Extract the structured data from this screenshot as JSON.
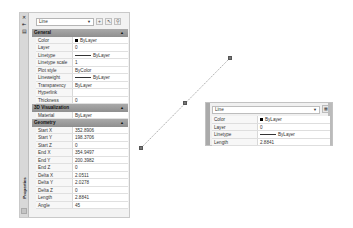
{
  "properties_palette": {
    "title": "Properties",
    "object_type": "Line",
    "toolbar": {
      "toggle_pickadd": "toggle-pickadd-icon",
      "select_objects": "select-objects-icon",
      "quick_select": "quick-select-icon"
    },
    "side_icons": [
      "close-icon",
      "auto-hide-icon",
      "properties-menu-icon"
    ],
    "sections": [
      {
        "name": "General",
        "rows": [
          {
            "key": "Color",
            "value": "ByLayer",
            "swatch": "#000000"
          },
          {
            "key": "Layer",
            "value": "0"
          },
          {
            "key": "Linetype",
            "value": "ByLayer",
            "line": true
          },
          {
            "key": "Linetype scale",
            "value": "1"
          },
          {
            "key": "Plot style",
            "value": "ByColor"
          },
          {
            "key": "Lineweight",
            "value": "ByLayer",
            "line": true
          },
          {
            "key": "Transparency",
            "value": "ByLayer"
          },
          {
            "key": "Hyperlink",
            "value": ""
          },
          {
            "key": "Thickness",
            "value": "0"
          }
        ]
      },
      {
        "name": "3D Visualization",
        "rows": [
          {
            "key": "Material",
            "value": "ByLayer"
          }
        ]
      },
      {
        "name": "Geometry",
        "rows": [
          {
            "key": "Start X",
            "value": "352.8906"
          },
          {
            "key": "Start Y",
            "value": "198.3706"
          },
          {
            "key": "Start Z",
            "value": "0"
          },
          {
            "key": "End X",
            "value": "354.9497"
          },
          {
            "key": "End Y",
            "value": "200.3982"
          },
          {
            "key": "End Z",
            "value": "0"
          },
          {
            "key": "Delta X",
            "value": "2.0511"
          },
          {
            "key": "Delta Y",
            "value": "2.0278"
          },
          {
            "key": "Delta Z",
            "value": "0"
          },
          {
            "key": "Length",
            "value": "2.8841"
          },
          {
            "key": "Angle",
            "value": "45"
          }
        ]
      }
    ]
  },
  "quick_properties": {
    "object_type": "Line",
    "rows": [
      {
        "key": "Color",
        "value": "ByLayer",
        "swatch": "#000000"
      },
      {
        "key": "Layer",
        "value": "0"
      },
      {
        "key": "Linetype",
        "value": "ByLayer",
        "line": true
      },
      {
        "key": "Length",
        "value": "2.8841"
      }
    ]
  },
  "drawing": {
    "line": {
      "x1": 141,
      "y1": 148,
      "x2": 230,
      "y2": 58
    },
    "grips": [
      {
        "x": 141,
        "y": 148
      },
      {
        "x": 185,
        "y": 103
      },
      {
        "x": 230,
        "y": 58
      }
    ]
  }
}
